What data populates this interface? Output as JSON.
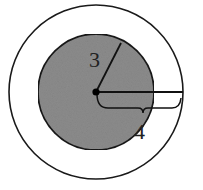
{
  "diagram": {
    "title": "",
    "labels": {
      "inner_radius": "3",
      "outer_radius": "4"
    },
    "colors": {
      "inner_fill": "#8c8c8c",
      "stroke": "#1a1a1a",
      "background": "#ffffff"
    },
    "shapes": {
      "outer_circle": {
        "cx": 96,
        "cy": 92,
        "r": 87
      },
      "inner_circle": {
        "cx": 96,
        "cy": 92,
        "r": 58
      }
    }
  }
}
